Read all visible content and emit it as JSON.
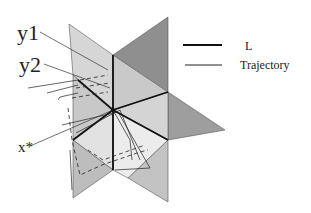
{
  "labels": {
    "y1": "y1",
    "y2": "y2",
    "xstar": "x*"
  },
  "legend": {
    "items": [
      {
        "label": "L",
        "style": "thick-line"
      },
      {
        "label": "Trajectory",
        "style": "thin-line"
      }
    ]
  },
  "colors": {
    "light_gray": "#d9d9d9",
    "mid_gray": "#bdbdbd",
    "dark_gray": "#8f8f8f",
    "lightest": "#ececec",
    "line": "#111111"
  }
}
